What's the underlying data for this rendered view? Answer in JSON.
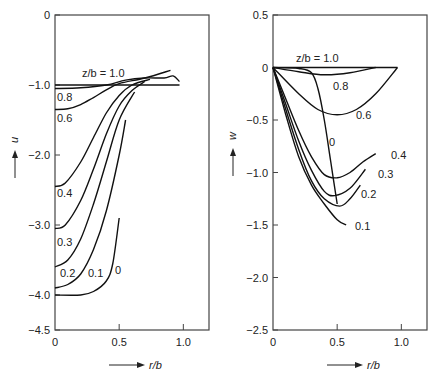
{
  "chart_data": [
    {
      "type": "line",
      "title": "",
      "xlabel": "r/b",
      "ylabel": "u",
      "xlim": [
        0,
        1.2
      ],
      "ylim": [
        -4.5,
        0
      ],
      "xticks": [
        0,
        0.5,
        1.0
      ],
      "xtick_labels": [
        "0",
        "0.5",
        "1.0"
      ],
      "yticks": [
        0,
        -1.0,
        -2.0,
        -3.0,
        -4.0,
        -4.5
      ],
      "ytick_labels": [
        "0",
        "−1.0",
        "−2.0",
        "−3.0",
        "−4.0",
        "−4.5"
      ],
      "grid": false,
      "legend_position": "inline curve labels",
      "series": [
        {
          "name": "z/b = 1.0",
          "label": "z/b = 1.0",
          "x": [
            0,
            0.2,
            0.4,
            0.6,
            0.8,
            0.97
          ],
          "y": [
            -1.0,
            -1.0,
            -1.0,
            -1.0,
            -1.0,
            -1.0
          ]
        },
        {
          "name": "0.8",
          "label": "0.8",
          "x": [
            0,
            0.2,
            0.4,
            0.55,
            0.7,
            0.85,
            0.92,
            0.97
          ],
          "y": [
            -1.05,
            -1.04,
            -1.0,
            -0.93,
            -0.9,
            -0.9,
            -0.87,
            -0.95
          ]
        },
        {
          "name": "0.6",
          "label": "0.6",
          "x": [
            0,
            0.1,
            0.2,
            0.3,
            0.4,
            0.5,
            0.7,
            0.9
          ],
          "y": [
            -1.35,
            -1.34,
            -1.28,
            -1.18,
            -1.07,
            -0.98,
            -0.9,
            -0.79
          ]
        },
        {
          "name": "0.4",
          "label": "0.4",
          "x": [
            0,
            0.08,
            0.2,
            0.3,
            0.4,
            0.5,
            0.6,
            0.74
          ],
          "y": [
            -2.45,
            -2.4,
            -2.1,
            -1.75,
            -1.4,
            -1.15,
            -1.0,
            -0.92
          ]
        },
        {
          "name": "0.3",
          "label": "0.3",
          "x": [
            0,
            0.08,
            0.2,
            0.3,
            0.4,
            0.5,
            0.6,
            0.7
          ],
          "y": [
            -3.05,
            -3.0,
            -2.65,
            -2.2,
            -1.7,
            -1.3,
            -1.08,
            -0.95
          ]
        },
        {
          "name": "0.2",
          "label": "0.2",
          "x": [
            0,
            0.1,
            0.2,
            0.3,
            0.4,
            0.5,
            0.62
          ],
          "y": [
            -3.6,
            -3.5,
            -3.2,
            -2.7,
            -2.1,
            -1.5,
            -1.1
          ]
        },
        {
          "name": "0.1",
          "label": "0.1",
          "x": [
            0,
            0.1,
            0.2,
            0.3,
            0.4,
            0.5,
            0.55
          ],
          "y": [
            -3.9,
            -3.85,
            -3.7,
            -3.35,
            -2.8,
            -2.0,
            -1.5
          ]
        },
        {
          "name": "0",
          "label": "0",
          "x": [
            0,
            0.2,
            0.3,
            0.4,
            0.45,
            0.5
          ],
          "y": [
            -4.0,
            -4.0,
            -3.95,
            -3.8,
            -3.55,
            -2.9
          ]
        }
      ]
    },
    {
      "type": "line",
      "title": "",
      "xlabel": "r/b",
      "ylabel": "w",
      "xlim": [
        0,
        1.2
      ],
      "ylim": [
        -2.5,
        0.5
      ],
      "xticks": [
        0,
        0.5,
        1.0
      ],
      "xtick_labels": [
        "0",
        "0.5",
        "1.0"
      ],
      "yticks": [
        0.5,
        0,
        -0.5,
        -1.0,
        -1.5,
        -2.0,
        -2.5
      ],
      "ytick_labels": [
        "0.5",
        "0",
        "−0.5",
        "−1.0",
        "−1.5",
        "−2.0",
        "−2.5"
      ],
      "grid": false,
      "legend_position": "inline curve labels",
      "series": [
        {
          "name": "z/b = 1.0",
          "label": "z/b = 1.0",
          "x": [
            0,
            0.5,
            0.97
          ],
          "y": [
            0,
            0,
            0
          ]
        },
        {
          "name": "0.8",
          "label": "0.8",
          "x": [
            0,
            0.2,
            0.4,
            0.6,
            0.8
          ],
          "y": [
            0,
            -0.04,
            -0.07,
            -0.05,
            0
          ]
        },
        {
          "name": "0.6",
          "label": "0.6",
          "x": [
            0,
            0.2,
            0.35,
            0.5,
            0.65,
            0.8,
            0.97
          ],
          "y": [
            0,
            -0.25,
            -0.4,
            -0.45,
            -0.4,
            -0.25,
            0
          ]
        },
        {
          "name": "0",
          "label": "0",
          "x": [
            0,
            0.2,
            0.3,
            0.35,
            0.4,
            0.45,
            0.5
          ],
          "y": [
            0,
            -0.01,
            -0.05,
            -0.2,
            -0.5,
            -0.9,
            -1.3
          ]
        },
        {
          "name": "0.4",
          "label": "0.4",
          "x": [
            0,
            0.1,
            0.2,
            0.3,
            0.4,
            0.5,
            0.6,
            0.7,
            0.8
          ],
          "y": [
            0,
            -0.3,
            -0.6,
            -0.85,
            -1.02,
            -1.05,
            -1.0,
            -0.9,
            -0.82
          ]
        },
        {
          "name": "0.3",
          "label": "0.3",
          "x": [
            0,
            0.1,
            0.2,
            0.3,
            0.4,
            0.48,
            0.6,
            0.72
          ],
          "y": [
            0,
            -0.35,
            -0.7,
            -0.98,
            -1.18,
            -1.22,
            -1.15,
            -0.97
          ]
        },
        {
          "name": "0.2",
          "label": "0.2",
          "x": [
            0,
            0.1,
            0.2,
            0.3,
            0.4,
            0.52,
            0.6,
            0.68
          ],
          "y": [
            0,
            -0.4,
            -0.78,
            -1.08,
            -1.25,
            -1.32,
            -1.25,
            -1.12
          ]
        },
        {
          "name": "0.1",
          "label": "0.1",
          "x": [
            0,
            0.1,
            0.2,
            0.3,
            0.4,
            0.5,
            0.57
          ],
          "y": [
            0,
            -0.45,
            -0.85,
            -1.12,
            -1.3,
            -1.45,
            -1.5
          ]
        }
      ]
    }
  ]
}
